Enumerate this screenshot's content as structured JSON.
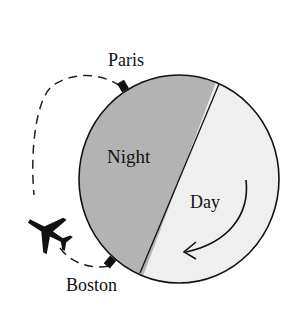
{
  "diagram": {
    "type": "day-night flight illustration",
    "labels": {
      "top_city": "Paris",
      "bottom_city": "Boston",
      "night_region": "Night",
      "day_region": "Day"
    },
    "colors": {
      "night_fill": "#b3b3b3",
      "day_fill": "#efefef",
      "outline": "#111111",
      "flight_path": "#222222",
      "plane": "#111111"
    },
    "icons": {
      "plane": "airplane-icon",
      "rotation_arrow": "curved-arrow-icon",
      "city_marker": "city-marker-icon"
    }
  }
}
